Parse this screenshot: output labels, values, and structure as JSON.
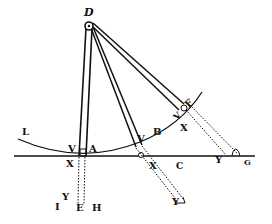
{
  "diagram": {
    "type": "geometric-mechanics-figure",
    "ink_color": "#111111",
    "background": "#ffffff",
    "labels": {
      "D": "D",
      "L": "L",
      "V1": "V",
      "A": "A",
      "X1": "X",
      "V2": "V",
      "B": "B",
      "X2": "X",
      "C": "C",
      "V3": "V",
      "F": "F",
      "X3": "X",
      "Y1": "Y",
      "G": "G",
      "Y2": "Y",
      "I": "I",
      "Y3": "Y",
      "E": "E",
      "H": "H"
    },
    "elements": [
      "pivot circle at D",
      "rod D-A (vertical)",
      "rod D-B extending dotted to Y",
      "rod D-F extending dotted to G",
      "arc L through V, A, V, B, V, F",
      "horizontal base line through X, A, C, Y, G",
      "dotted line from A down to E"
    ]
  }
}
